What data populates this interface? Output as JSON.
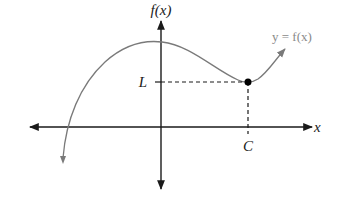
{
  "diagram": {
    "labels": {
      "y_axis": "f(x)",
      "x_axis": "x",
      "curve": "y = f(x)",
      "point_y": "L",
      "point_x": "C"
    },
    "colors": {
      "axis": "#1a1a1a",
      "curve": "#7a7a7a",
      "curve_label": "#8a8a8a",
      "dashed": "#1a1a1a",
      "point": "#000000"
    },
    "point": {
      "x_label": "C",
      "y_label": "L"
    }
  }
}
